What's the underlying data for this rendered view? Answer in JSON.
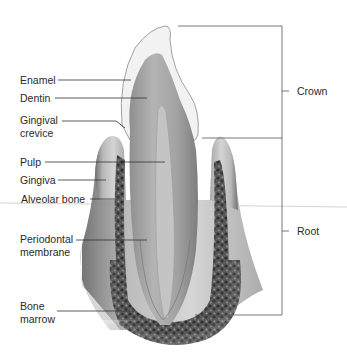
{
  "diagram": {
    "labels_left": [
      {
        "id": "enamel",
        "text": "Enamel"
      },
      {
        "id": "dentin",
        "text": "Dentin"
      },
      {
        "id": "gingival-crevice",
        "lines": [
          "Gingival",
          "crevice"
        ]
      },
      {
        "id": "pulp",
        "text": "Pulp"
      },
      {
        "id": "gingiva",
        "text": "Gingiva"
      },
      {
        "id": "alveolar-bone",
        "text": "Alveolar bone"
      },
      {
        "id": "periodontal-membrane",
        "lines": [
          "Periodontal",
          "membrane"
        ]
      },
      {
        "id": "bone-marrow",
        "lines": [
          "Bone",
          "marrow"
        ]
      }
    ],
    "labels_right": [
      {
        "id": "crown",
        "text": "Crown"
      },
      {
        "id": "root",
        "text": "Root"
      }
    ],
    "colors": {
      "enamel": "#f1f1f1",
      "dentin": "#a9a9a9",
      "pulp": "#bdbdbd",
      "gingiva": "#9a9a9a",
      "bone": "#4a4a4a",
      "bracket": "#555555",
      "leader": "#333333"
    }
  }
}
